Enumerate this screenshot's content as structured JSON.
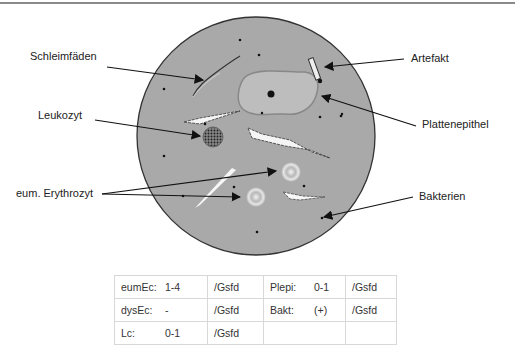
{
  "diagram": {
    "type": "microscope-field-urine-sediment",
    "labels": {
      "schleimfaeden": "Schleimfäden",
      "leukozyt": "Leukozyt",
      "erythrozyt": "eum. Erythrozyt",
      "artefakt": "Artefakt",
      "plattenepithel": "Plattenepithel",
      "bakterien": "Bakterien"
    },
    "colors": {
      "field": "#a9a9a9",
      "field_border": "#333333",
      "epithel": "#bdbdbd"
    }
  },
  "table": {
    "rows": [
      {
        "k1": "eumEc:",
        "v1": "1-4",
        "u1": "/Gsfd",
        "k2": "Plepi:",
        "v2": "0-1",
        "u2": "/Gsfd"
      },
      {
        "k1": "dysEc:",
        "v1": "-",
        "u1": "/Gsfd",
        "k2": "Bakt:",
        "v2": "(+)",
        "u2": "/Gsfd"
      },
      {
        "k1": "Lc:",
        "v1": "0-1",
        "u1": "/Gsfd",
        "k2": "",
        "v2": "",
        "u2": ""
      }
    ]
  }
}
